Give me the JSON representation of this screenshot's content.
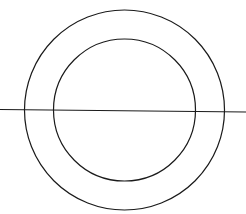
{
  "canvas": {
    "width": 246,
    "height": 214,
    "background": "#ffffff"
  },
  "stroke": {
    "color": "#1a1a1a",
    "width": 1.2
  },
  "shapes": {
    "outer_circle": {
      "cx": 124.5,
      "cy": 110,
      "r": 100
    },
    "inner_circle": {
      "cx": 124.5,
      "cy": 110,
      "r": 71
    },
    "horizontal_line": {
      "x1": 0,
      "y1": 109.5,
      "x2": 246,
      "y2": 112
    }
  }
}
